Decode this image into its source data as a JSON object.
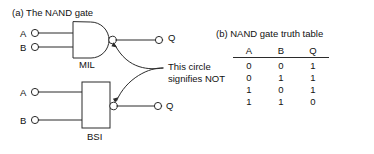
{
  "figure": {
    "part_a": {
      "caption": "(a) The NAND gate",
      "mil": {
        "input_a_label": "A",
        "input_b_label": "B",
        "output_label": "Q",
        "name": "MIL"
      },
      "bsi": {
        "input_a_label": "A",
        "input_b_label": "B",
        "output_label": "Q",
        "name": "BSI",
        "symbol": "&"
      },
      "annotation": {
        "line1": "This circle",
        "line2": "signifies NOT"
      }
    },
    "part_b": {
      "caption": "(b) NAND gate truth table",
      "table": {
        "headers": [
          "A",
          "B",
          "Q"
        ],
        "rows": [
          [
            "0",
            "0",
            "1"
          ],
          [
            "0",
            "1",
            "1"
          ],
          [
            "1",
            "0",
            "1"
          ],
          [
            "1",
            "1",
            "0"
          ]
        ]
      }
    },
    "colors": {
      "ink": "#1a1a1a",
      "line": "#2b2b2b",
      "background": "#ffffff"
    }
  }
}
